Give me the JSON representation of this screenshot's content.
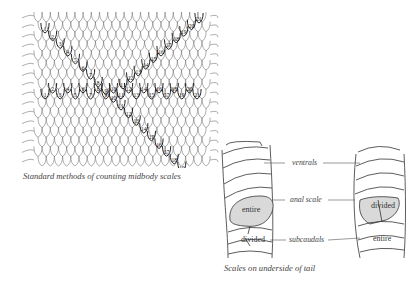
{
  "figures": {
    "midbody": {
      "caption": "Standard methods of counting midbody scales",
      "diagonal_down_numbers": [
        "1",
        "2",
        "3",
        "4",
        "5",
        "6",
        "7",
        "8",
        "9",
        "10",
        "11",
        "12",
        "13",
        "14",
        "15",
        "16",
        "17",
        "18",
        "19",
        "20",
        "21"
      ],
      "horizontal_numbers": [
        "1",
        "2",
        "3",
        "4",
        "5",
        "6",
        "7",
        "8",
        "9",
        "10",
        "11",
        "12",
        "13",
        "14",
        "15",
        "16",
        "17",
        "18",
        "19",
        "20",
        "21"
      ],
      "diagonal_up_numbers": [
        "11",
        "12",
        "13",
        "14",
        "15",
        "16",
        "17",
        "18",
        "19",
        "20",
        "21"
      ]
    },
    "tail": {
      "caption": "Scales on underside of tail",
      "labels": {
        "ventrals": "ventrals",
        "anal_scale": "anal scale",
        "subcaudals": "subcaudals"
      },
      "left_specimen": {
        "anal": "entire",
        "subcaudal": "divided"
      },
      "right_specimen": {
        "anal": "divided",
        "subcaudal": "entire"
      },
      "highlight_color": "#d9d9d9"
    }
  }
}
